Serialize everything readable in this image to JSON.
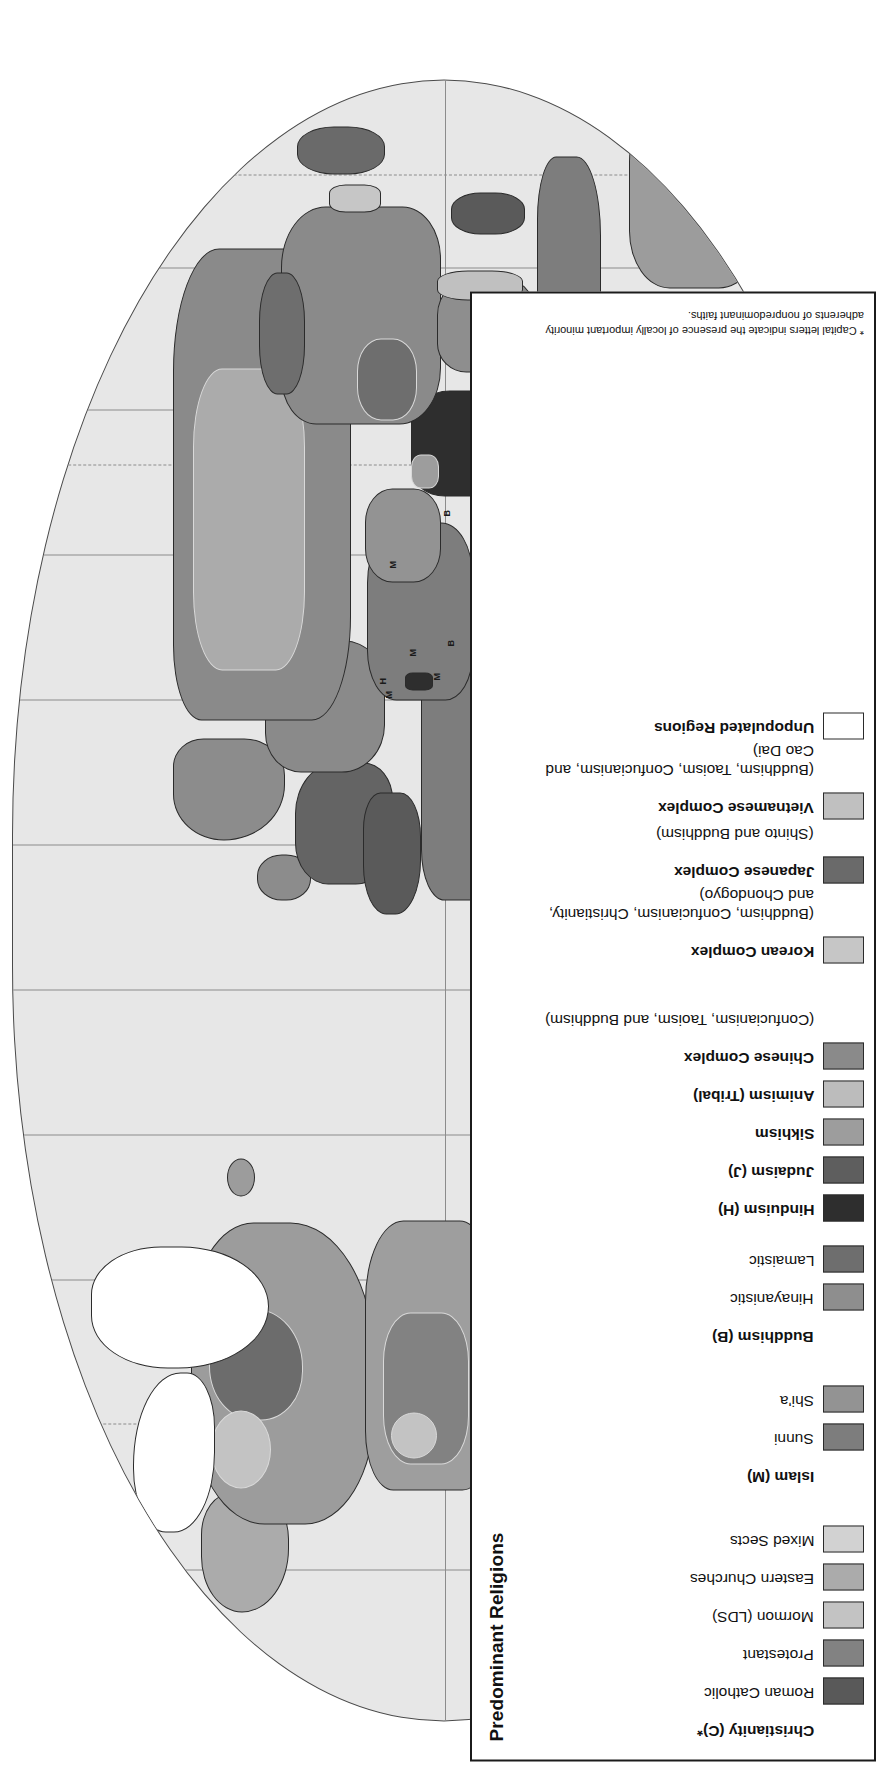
{
  "map": {
    "title": "Predominant Religions",
    "projection_note": "oval world projection",
    "scale": {
      "label": "Scale:  1 to 180,000,000",
      "miles": {
        "unit": "Miles",
        "unit_label": "2000 Miles",
        "ticks": [
          "0",
          "1000",
          "2000"
        ]
      },
      "kilometers": {
        "unit": "Kilometers",
        "unit_label": "3000 Kilometers",
        "ticks": [
          "0",
          "1000",
          "2000",
          "3000"
        ]
      }
    },
    "map_letter_labels": [
      "M",
      "M",
      "M",
      "M",
      "H",
      "B",
      "B",
      "H"
    ]
  },
  "legend": {
    "title": "Predominant Religions",
    "footnote": "*  Capital letters indicate the presence of locally important minority adherents of nonpredominant faiths.",
    "groups": [
      {
        "name": "christianity",
        "header": "Christianity (C)*",
        "header_swatch": null,
        "items": [
          {
            "label": "Roman Catholic",
            "color": "#595959",
            "bold": false
          },
          {
            "label": "Protestant",
            "color": "#828282",
            "bold": false
          },
          {
            "label": "Mormon (LDS)",
            "color": "#c3c3c3",
            "bold": false
          },
          {
            "label": "Eastern Churches",
            "color": "#ababab",
            "bold": false
          },
          {
            "label": "Mixed Sects",
            "color": "#d2d2d2",
            "bold": false
          }
        ]
      },
      {
        "name": "islam",
        "header": "Islam (M)",
        "header_swatch": null,
        "items": [
          {
            "label": "Sunni",
            "color": "#7d7d7d",
            "bold": false
          },
          {
            "label": "Shi'a",
            "color": "#939393",
            "bold": false
          }
        ]
      },
      {
        "name": "buddhism",
        "header": "Buddhism (B)",
        "header_swatch": null,
        "items": [
          {
            "label": "Hinayanistic",
            "color": "#8e8e8e",
            "bold": false
          },
          {
            "label": "Lamaistic",
            "color": "#6e6e6e",
            "bold": false
          }
        ]
      },
      {
        "name": "single-entries",
        "header": null,
        "items": [
          {
            "label": "Hinduism (H)",
            "color": "#2e2e2e",
            "bold": true
          },
          {
            "label": "Judaism (J)",
            "color": "#5e5e5e",
            "bold": true
          },
          {
            "label": "Sikhism",
            "color": "#9d9d9d",
            "bold": true
          },
          {
            "label": "Animism (Tribal)",
            "color": "#bcbcbc",
            "bold": true
          },
          {
            "label": "Chinese Complex",
            "sub": "(Confucianism, Taoism, and Buddhism)",
            "color": "#8a8a8a",
            "bold": true
          }
        ]
      },
      {
        "name": "complexes",
        "header": null,
        "items": [
          {
            "label": "Korean Complex",
            "sub": "(Buddhism, Confucianism, Christianity, and Chondogyo)",
            "color": "#c6c6c6",
            "bold": true
          },
          {
            "label": "Japanese Complex",
            "sub": "(Shinto and Buddhism)",
            "color": "#6a6a6a",
            "bold": true
          },
          {
            "label": "Vietnamese Complex",
            "sub": "(Buddhism, Taoism, Confucianism, and Cao Dai)",
            "color": "#c0c0c0",
            "bold": true
          },
          {
            "label": "Unpopulated Regions",
            "color": "#ffffff",
            "bold": true
          }
        ]
      }
    ]
  }
}
